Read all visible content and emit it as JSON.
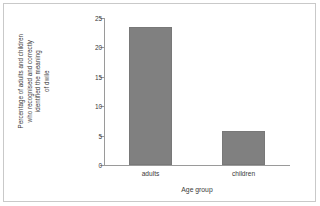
{
  "chart_data": {
    "type": "bar",
    "title": "",
    "categories": [
      "adults",
      "children"
    ],
    "values": [
      23.5,
      5.8
    ],
    "xlabel": "Age group",
    "ylabel": "Percentage of adults and children who recognised and correctly identified the meaning of dwile",
    "ylabel_lines": [
      "Percentage of adults and children",
      "who recognised and correctly",
      "identified the meaning",
      "of dwile"
    ],
    "ylim": [
      0,
      25
    ],
    "yticks": [
      0,
      5,
      10,
      15,
      20,
      25
    ],
    "ytick_labels": [
      "0",
      "5",
      "10",
      "15",
      "20",
      "25"
    ],
    "grid": false,
    "legend": "none",
    "bar_color": "#808080",
    "axis_color": "#9a9a9a",
    "text_color": "#3a3a3a",
    "frame_color": "#c9c9c9"
  }
}
